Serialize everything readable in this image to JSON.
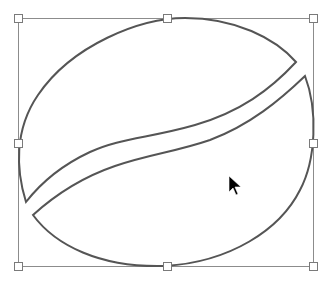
{
  "canvas": {
    "width": 331,
    "height": 284,
    "background": "#ffffff"
  },
  "shape": {
    "name": "coffee-bean",
    "stroke_color": "#555555",
    "fill_color": "#ffffff",
    "selected": true
  },
  "selection": {
    "bbox": {
      "x": 18,
      "y": 18,
      "width": 295,
      "height": 248
    },
    "bbox_color": "#8c8c8c",
    "handle_size": 8,
    "handles": [
      {
        "id": "top-left",
        "x": 18,
        "y": 18
      },
      {
        "id": "top-middle",
        "x": 167,
        "y": 18
      },
      {
        "id": "top-right",
        "x": 313,
        "y": 18
      },
      {
        "id": "middle-left",
        "x": 18,
        "y": 143
      },
      {
        "id": "middle-right",
        "x": 313,
        "y": 143
      },
      {
        "id": "bottom-left",
        "x": 18,
        "y": 266
      },
      {
        "id": "bottom-middle",
        "x": 167,
        "y": 266
      },
      {
        "id": "bottom-right",
        "x": 313,
        "y": 266
      }
    ]
  },
  "cursor": {
    "type": "arrow-pointer",
    "x": 229,
    "y": 176,
    "color": "#000000"
  }
}
